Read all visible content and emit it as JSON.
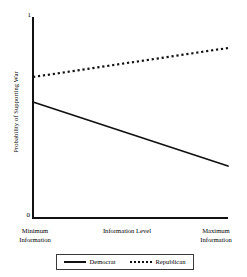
{
  "chart_data": {
    "type": "line",
    "title": "",
    "xlabel": "Information Level",
    "ylabel": "Probability of Supporting War",
    "x": [
      0,
      1
    ],
    "xtick_labels": [
      "Minimum Information",
      "Maximum Information"
    ],
    "xtick_label_lines": [
      [
        "Minimum",
        "Information"
      ],
      [
        "Maximum",
        "Information"
      ]
    ],
    "ytick_labels": [
      "0",
      "1"
    ],
    "ylim": [
      0,
      1
    ],
    "xlim": [
      0,
      1
    ],
    "grid": false,
    "legend_position": "bottom",
    "series": [
      {
        "name": "Democrat",
        "style": "solid",
        "color": "#111111",
        "values": [
          0.58,
          0.26
        ]
      },
      {
        "name": "Republican",
        "style": "dotted",
        "color": "#111111",
        "values": [
          0.705,
          0.85
        ]
      }
    ]
  },
  "axes": {
    "y_top_tick": "1",
    "y_bottom_tick": "0",
    "y_axis_title": "Probability of Supporting War",
    "x_axis_title": "Information Level",
    "x_left_line1": "Minimum",
    "x_left_line2": "Information",
    "x_right_line1": "Maximum",
    "x_right_line2": "Information"
  },
  "legend": {
    "entries": [
      {
        "label": "Democrat",
        "style": "solid"
      },
      {
        "label": "Republican",
        "style": "dotted"
      }
    ]
  },
  "colors": {
    "line": "#111111",
    "axis": "#111111",
    "legend_border": "#3a3a3a",
    "background": "#ffffff"
  }
}
